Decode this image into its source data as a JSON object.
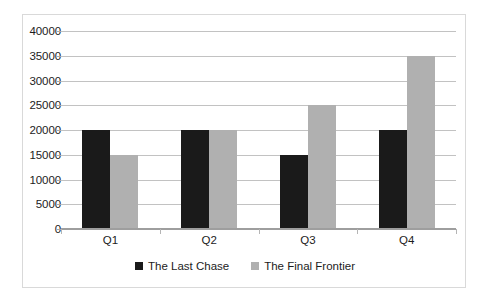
{
  "chart_data": {
    "type": "bar",
    "title": "",
    "subtitle": "",
    "xlabel": "",
    "ylabel": "",
    "categories": [
      "Q1",
      "Q2",
      "Q3",
      "Q4"
    ],
    "series": [
      {
        "name": "The Last Chase",
        "color": "#1a1a1a",
        "values": [
          20000,
          20000,
          15000,
          20000
        ]
      },
      {
        "name": "The Final Frontier",
        "color": "#b0b0b0",
        "values": [
          15000,
          20000,
          25000,
          35000
        ]
      }
    ],
    "ylim": [
      0,
      40000
    ],
    "ytick_step": 5000,
    "ytick_labels": [
      "40000",
      "35000",
      "30000",
      "25000",
      "20000",
      "15000",
      "10000",
      "5000",
      "0"
    ],
    "ytick_values": [
      40000,
      35000,
      30000,
      25000,
      20000,
      15000,
      10000,
      5000,
      0
    ],
    "grid": true,
    "grid_axis": "y",
    "legend_position": "bottom",
    "bar_mode": "grouped"
  }
}
